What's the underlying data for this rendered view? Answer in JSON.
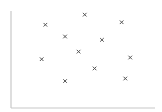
{
  "chart_data": {
    "type": "scatter",
    "title": "",
    "xlabel": "",
    "ylabel": "",
    "marker": "x",
    "grid": false,
    "legend": null,
    "xlim": [
      0,
      100
    ],
    "ylim": [
      0,
      100
    ],
    "series": [
      {
        "name": "points",
        "color": "#555555",
        "x": [
          19,
          51,
          81,
          35,
          65,
          46,
          16,
          88,
          59,
          35,
          84
        ],
        "y": [
          86,
          98,
          89,
          72,
          68,
          54,
          45,
          47,
          34,
          19,
          22
        ]
      }
    ]
  },
  "axes": {
    "color": "#c8c8c8",
    "origin_px": [
      11,
      108
    ],
    "x_end_px": 155,
    "y_top_px": 11
  }
}
